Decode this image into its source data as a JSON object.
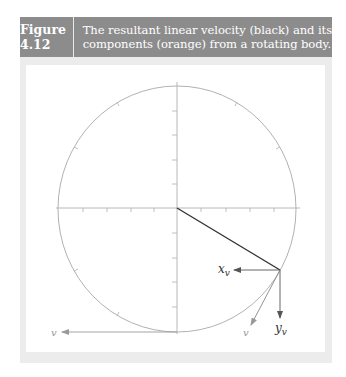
{
  "figure": {
    "number": "Figure 4.12",
    "caption_line1": "The resultant linear velocity (black) and its",
    "caption_line2": "components (orange) from a rotating body."
  },
  "diagram": {
    "labels": {
      "xv": "x",
      "xv_sub": "v",
      "yv": "y",
      "yv_sub": "v",
      "v_rotating": "v",
      "v_bottom": "v"
    },
    "colors": {
      "header_bg": "#8c8c8c",
      "circle": "#a8a8a8",
      "axes": "#b0b0b0",
      "resultant": "#333333",
      "components": "#555555"
    }
  }
}
